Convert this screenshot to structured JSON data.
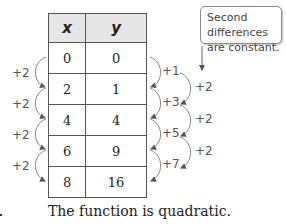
{
  "table": {
    "headers": [
      "x",
      "y"
    ],
    "rows": [
      [
        "0",
        "0"
      ],
      [
        "2",
        "1"
      ],
      [
        "4",
        "4"
      ],
      [
        "6",
        "9"
      ],
      [
        "8",
        "16"
      ]
    ]
  },
  "x_differences": [
    "+2",
    "+2",
    "+2",
    "+2"
  ],
  "first_differences": [
    "+1",
    "+3",
    "+5",
    "+7"
  ],
  "second_differences": [
    "+2",
    "+2",
    "+2"
  ],
  "callout": {
    "line1": "Second differences",
    "line2": "are constant."
  },
  "caption": "The function is quadratic.",
  "colors": {
    "header_bg": "#e6e6e6",
    "border": "#555555",
    "annotation": "#555555"
  }
}
